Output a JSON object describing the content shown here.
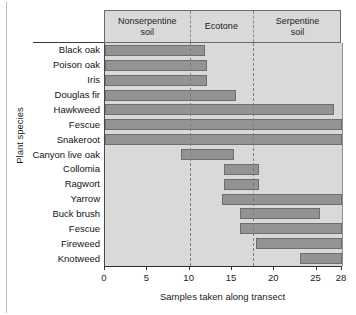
{
  "chart_data": {
    "type": "bar",
    "orientation": "horizontal",
    "title": "",
    "xlabel": "Samples taken along transect",
    "ylabel": "Plant species",
    "xlim": [
      0,
      28
    ],
    "xticks": [
      0,
      5,
      10,
      15,
      20,
      25,
      28
    ],
    "xticklabels": [
      "0",
      "5",
      "10",
      "15",
      "20",
      "25",
      "28"
    ],
    "grid": false,
    "legend": "none",
    "categories": [
      "Black oak",
      "Poison oak",
      "Iris",
      "Douglas fir",
      "Hawkweed",
      "Fescue",
      "Snakeroot",
      "Canyon live oak",
      "Collomia",
      "Ragwort",
      "Yarrow",
      "Buck brush",
      "Fescue",
      "Fireweed",
      "Knotweed"
    ],
    "bars": [
      {
        "category": "Black oak",
        "start": 0,
        "end": 11.8
      },
      {
        "category": "Poison oak",
        "start": 0,
        "end": 12.0
      },
      {
        "category": "Iris",
        "start": 0,
        "end": 12.0
      },
      {
        "category": "Douglas fir",
        "start": 0,
        "end": 15.5
      },
      {
        "category": "Hawkweed",
        "start": 0,
        "end": 27.0
      },
      {
        "category": "Fescue",
        "start": 0,
        "end": 28.0
      },
      {
        "category": "Snakeroot",
        "start": 0,
        "end": 28.0
      },
      {
        "category": "Canyon live oak",
        "start": 9.0,
        "end": 15.2
      },
      {
        "category": "Collomia",
        "start": 14.0,
        "end": 18.2
      },
      {
        "category": "Ragwort",
        "start": 14.0,
        "end": 18.2
      },
      {
        "category": "Yarrow",
        "start": 13.8,
        "end": 28.0
      },
      {
        "category": "Buck brush",
        "start": 16.0,
        "end": 25.4
      },
      {
        "category": "Fescue",
        "start": 16.0,
        "end": 28.0
      },
      {
        "category": "Fireweed",
        "start": 17.8,
        "end": 28.0
      },
      {
        "category": "Knotweed",
        "start": 23.0,
        "end": 28.0
      }
    ],
    "zones": [
      {
        "label": "Nonserpentine\nsoil",
        "start": 0,
        "end": 10.0
      },
      {
        "label": "Ecotone",
        "start": 10.0,
        "end": 17.5
      },
      {
        "label": "Serpentine\nsoil",
        "start": 17.5,
        "end": 28.0
      }
    ],
    "zone_dividers": [
      10.0,
      17.5
    ],
    "colors": {
      "bar_fill": "#939393",
      "bar_edge": "#6e6e6e",
      "plot_background": "#d9d9d9",
      "zone_band_background": "#d9d9d9",
      "axis": "#2f2f2f",
      "divider": "#7c7c7c",
      "text": "#1c1c1c"
    }
  },
  "zone_labels": {
    "nonserpentine_line1": "Nonserpentine",
    "nonserpentine_line2": "soil",
    "ecotone": "Ecotone",
    "serpentine_line1": "Serpentine",
    "serpentine_line2": "soil"
  },
  "axis": {
    "xlabel": "Samples taken along transect",
    "ylabel": "Plant species"
  }
}
